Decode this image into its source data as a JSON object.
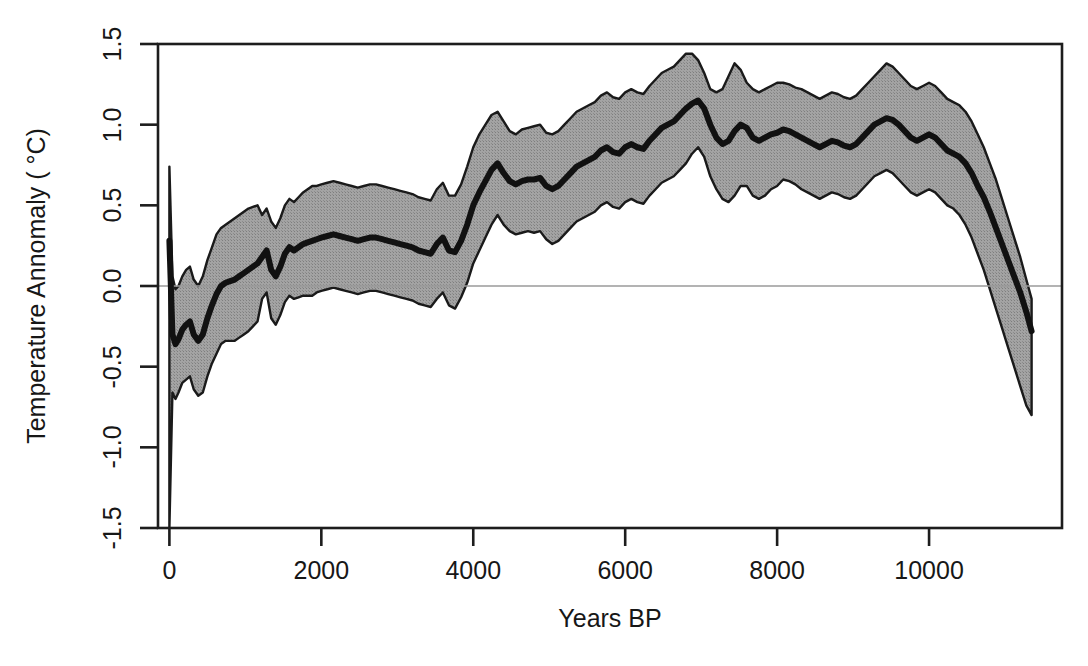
{
  "chart_data": {
    "type": "line",
    "title": "",
    "subtitle": "",
    "xlabel": "Years BP",
    "ylabel": "Temperature Annomaly ( °C)",
    "xlim": [
      -150,
      11750
    ],
    "ylim": [
      -1.5,
      1.5
    ],
    "xticks": [
      0,
      2000,
      4000,
      6000,
      8000,
      10000
    ],
    "xtick_labels": [
      "0",
      "2000",
      "4000",
      "6000",
      "8000",
      "10000"
    ],
    "yticks": [
      -1.5,
      -1.0,
      -0.5,
      0.0,
      0.5,
      1.0,
      1.5
    ],
    "ytick_labels": [
      "-1.5",
      "-1.0",
      "-0.5",
      "0.0",
      "0.5",
      "1.0",
      "1.5"
    ],
    "grid": false,
    "reference_lines": [
      {
        "axis": "y",
        "value": 0.0,
        "color": "#9a9a9a",
        "width": 1.5
      }
    ],
    "legend": null,
    "colors": {
      "band_fill": "#989898",
      "band_edge": "#1a1a1a",
      "mean_line": "#111111",
      "axis": "#1d1d1d",
      "zero_line": "#9a9a9a",
      "background": "#ffffff"
    },
    "series": [
      {
        "name": "mean temperature anomaly",
        "kind": "line",
        "line_width": 6,
        "color": "#111111",
        "x": [
          0,
          40,
          80,
          120,
          170,
          220,
          270,
          320,
          380,
          440,
          500,
          560,
          620,
          680,
          740,
          800,
          860,
          920,
          980,
          1040,
          1100,
          1160,
          1220,
          1280,
          1340,
          1400,
          1460,
          1520,
          1580,
          1640,
          1700,
          1760,
          1820,
          1880,
          1940,
          2000,
          2080,
          2160,
          2240,
          2320,
          2400,
          2480,
          2560,
          2640,
          2720,
          2800,
          2880,
          2960,
          3040,
          3120,
          3200,
          3280,
          3360,
          3440,
          3520,
          3600,
          3680,
          3760,
          3840,
          3920,
          4000,
          4080,
          4160,
          4240,
          4320,
          4400,
          4480,
          4560,
          4640,
          4720,
          4800,
          4880,
          4960,
          5040,
          5120,
          5200,
          5280,
          5360,
          5440,
          5520,
          5600,
          5680,
          5760,
          5840,
          5920,
          6000,
          6080,
          6160,
          6240,
          6320,
          6400,
          6480,
          6560,
          6640,
          6720,
          6800,
          6880,
          6960,
          7040,
          7120,
          7200,
          7280,
          7360,
          7440,
          7520,
          7600,
          7680,
          7760,
          7840,
          7920,
          8000,
          8080,
          8160,
          8240,
          8320,
          8400,
          8480,
          8560,
          8640,
          8720,
          8800,
          8880,
          8960,
          9040,
          9120,
          9200,
          9280,
          9360,
          9440,
          9520,
          9600,
          9680,
          9760,
          9840,
          9920,
          10000,
          10080,
          10160,
          10240,
          10320,
          10400,
          10480,
          10560,
          10640,
          10720,
          10800,
          10880,
          10960,
          11040,
          11120,
          11200,
          11280,
          11350
        ],
        "y": [
          0.28,
          -0.3,
          -0.36,
          -0.33,
          -0.27,
          -0.24,
          -0.22,
          -0.3,
          -0.34,
          -0.3,
          -0.2,
          -0.12,
          -0.05,
          0.0,
          0.02,
          0.03,
          0.04,
          0.06,
          0.08,
          0.1,
          0.12,
          0.14,
          0.18,
          0.22,
          0.1,
          0.06,
          0.12,
          0.2,
          0.24,
          0.22,
          0.24,
          0.26,
          0.27,
          0.28,
          0.29,
          0.3,
          0.31,
          0.32,
          0.31,
          0.3,
          0.29,
          0.28,
          0.29,
          0.3,
          0.3,
          0.29,
          0.28,
          0.27,
          0.26,
          0.25,
          0.24,
          0.22,
          0.21,
          0.2,
          0.26,
          0.3,
          0.22,
          0.21,
          0.28,
          0.38,
          0.5,
          0.58,
          0.65,
          0.72,
          0.76,
          0.7,
          0.65,
          0.63,
          0.65,
          0.66,
          0.66,
          0.67,
          0.62,
          0.6,
          0.62,
          0.66,
          0.7,
          0.74,
          0.76,
          0.78,
          0.8,
          0.84,
          0.86,
          0.83,
          0.82,
          0.86,
          0.88,
          0.86,
          0.85,
          0.9,
          0.94,
          0.98,
          1.0,
          1.02,
          1.06,
          1.1,
          1.13,
          1.15,
          1.1,
          1.0,
          0.92,
          0.88,
          0.9,
          0.96,
          1.0,
          0.98,
          0.92,
          0.9,
          0.92,
          0.94,
          0.95,
          0.97,
          0.96,
          0.94,
          0.92,
          0.9,
          0.88,
          0.86,
          0.88,
          0.9,
          0.89,
          0.87,
          0.86,
          0.88,
          0.92,
          0.96,
          1.0,
          1.02,
          1.04,
          1.03,
          1.0,
          0.96,
          0.92,
          0.9,
          0.92,
          0.94,
          0.92,
          0.88,
          0.84,
          0.82,
          0.8,
          0.76,
          0.7,
          0.62,
          0.55,
          0.46,
          0.36,
          0.26,
          0.16,
          0.06,
          -0.04,
          -0.16,
          -0.28
        ]
      },
      {
        "name": "uncertainty band upper (95%)",
        "kind": "band_upper",
        "color": "#1a1a1a",
        "x": [
          0,
          40,
          80,
          120,
          170,
          220,
          270,
          320,
          380,
          440,
          500,
          560,
          620,
          680,
          740,
          800,
          860,
          920,
          980,
          1040,
          1100,
          1160,
          1220,
          1280,
          1340,
          1400,
          1460,
          1520,
          1580,
          1640,
          1700,
          1760,
          1820,
          1880,
          1940,
          2000,
          2080,
          2160,
          2240,
          2320,
          2400,
          2480,
          2560,
          2640,
          2720,
          2800,
          2880,
          2960,
          3040,
          3120,
          3200,
          3280,
          3360,
          3440,
          3520,
          3600,
          3680,
          3760,
          3840,
          3920,
          4000,
          4080,
          4160,
          4240,
          4320,
          4400,
          4480,
          4560,
          4640,
          4720,
          4800,
          4880,
          4960,
          5040,
          5120,
          5200,
          5280,
          5360,
          5440,
          5520,
          5600,
          5680,
          5760,
          5840,
          5920,
          6000,
          6080,
          6160,
          6240,
          6320,
          6400,
          6480,
          6560,
          6640,
          6720,
          6800,
          6880,
          6960,
          7040,
          7120,
          7200,
          7280,
          7360,
          7440,
          7520,
          7600,
          7680,
          7760,
          7840,
          7920,
          8000,
          8080,
          8160,
          8240,
          8320,
          8400,
          8480,
          8560,
          8640,
          8720,
          8800,
          8880,
          8960,
          9040,
          9120,
          9200,
          9280,
          9360,
          9440,
          9520,
          9600,
          9680,
          9760,
          9840,
          9920,
          10000,
          10080,
          10160,
          10240,
          10320,
          10400,
          10480,
          10560,
          10640,
          10720,
          10800,
          10880,
          10960,
          11040,
          11120,
          11200,
          11280,
          11350
        ],
        "y": [
          0.74,
          0.06,
          -0.02,
          0.0,
          0.06,
          0.1,
          0.12,
          0.04,
          0.0,
          0.06,
          0.16,
          0.24,
          0.32,
          0.36,
          0.38,
          0.4,
          0.42,
          0.44,
          0.46,
          0.48,
          0.49,
          0.5,
          0.44,
          0.48,
          0.4,
          0.36,
          0.42,
          0.5,
          0.54,
          0.52,
          0.55,
          0.58,
          0.6,
          0.62,
          0.62,
          0.63,
          0.64,
          0.65,
          0.64,
          0.63,
          0.62,
          0.61,
          0.62,
          0.63,
          0.63,
          0.62,
          0.61,
          0.6,
          0.59,
          0.58,
          0.57,
          0.55,
          0.54,
          0.53,
          0.6,
          0.64,
          0.56,
          0.56,
          0.63,
          0.74,
          0.86,
          0.94,
          1.0,
          1.06,
          1.08,
          1.02,
          0.96,
          0.94,
          0.97,
          0.98,
          0.99,
          1.0,
          0.95,
          0.94,
          0.96,
          1.0,
          1.04,
          1.08,
          1.1,
          1.12,
          1.14,
          1.18,
          1.2,
          1.17,
          1.16,
          1.2,
          1.22,
          1.2,
          1.19,
          1.24,
          1.28,
          1.32,
          1.34,
          1.36,
          1.4,
          1.44,
          1.44,
          1.4,
          1.32,
          1.22,
          1.2,
          1.22,
          1.3,
          1.38,
          1.34,
          1.26,
          1.22,
          1.2,
          1.22,
          1.24,
          1.26,
          1.26,
          1.25,
          1.23,
          1.22,
          1.2,
          1.18,
          1.16,
          1.18,
          1.2,
          1.19,
          1.17,
          1.16,
          1.18,
          1.22,
          1.26,
          1.3,
          1.34,
          1.38,
          1.36,
          1.32,
          1.28,
          1.24,
          1.22,
          1.24,
          1.26,
          1.24,
          1.2,
          1.16,
          1.14,
          1.12,
          1.08,
          1.02,
          0.94,
          0.86,
          0.76,
          0.66,
          0.54,
          0.42,
          0.3,
          0.18,
          0.04,
          -0.08
        ]
      },
      {
        "name": "uncertainty band lower (95%)",
        "kind": "band_lower",
        "color": "#1a1a1a",
        "x": [
          0,
          40,
          80,
          120,
          170,
          220,
          270,
          320,
          380,
          440,
          500,
          560,
          620,
          680,
          740,
          800,
          860,
          920,
          980,
          1040,
          1100,
          1160,
          1220,
          1280,
          1340,
          1400,
          1460,
          1520,
          1580,
          1640,
          1700,
          1760,
          1820,
          1880,
          1940,
          2000,
          2080,
          2160,
          2240,
          2320,
          2400,
          2480,
          2560,
          2640,
          2720,
          2800,
          2880,
          2960,
          3040,
          3120,
          3200,
          3280,
          3360,
          3440,
          3520,
          3600,
          3680,
          3760,
          3840,
          3920,
          4000,
          4080,
          4160,
          4240,
          4320,
          4400,
          4480,
          4560,
          4640,
          4720,
          4800,
          4880,
          4960,
          5040,
          5120,
          5200,
          5280,
          5360,
          5440,
          5520,
          5600,
          5680,
          5760,
          5840,
          5920,
          6000,
          6080,
          6160,
          6240,
          6320,
          6400,
          6480,
          6560,
          6640,
          6720,
          6800,
          6880,
          6960,
          7040,
          7120,
          7200,
          7280,
          7360,
          7440,
          7520,
          7600,
          7680,
          7760,
          7840,
          7920,
          8000,
          8080,
          8160,
          8240,
          8320,
          8400,
          8480,
          8560,
          8640,
          8720,
          8800,
          8880,
          8960,
          9040,
          9120,
          9200,
          9280,
          9360,
          9440,
          9520,
          9600,
          9680,
          9760,
          9840,
          9920,
          10000,
          10080,
          10160,
          10240,
          10320,
          10400,
          10480,
          10560,
          10640,
          10720,
          10800,
          10880,
          10960,
          11040,
          11120,
          11200,
          11280,
          11350
        ],
        "y": [
          -1.5,
          -0.66,
          -0.7,
          -0.66,
          -0.6,
          -0.58,
          -0.56,
          -0.64,
          -0.68,
          -0.66,
          -0.56,
          -0.48,
          -0.42,
          -0.36,
          -0.34,
          -0.34,
          -0.34,
          -0.32,
          -0.3,
          -0.28,
          -0.25,
          -0.22,
          -0.08,
          -0.04,
          -0.2,
          -0.24,
          -0.18,
          -0.1,
          -0.06,
          -0.08,
          -0.07,
          -0.06,
          -0.06,
          -0.06,
          -0.04,
          -0.03,
          -0.02,
          -0.01,
          -0.02,
          -0.03,
          -0.04,
          -0.05,
          -0.04,
          -0.03,
          -0.03,
          -0.04,
          -0.05,
          -0.06,
          -0.07,
          -0.08,
          -0.09,
          -0.11,
          -0.12,
          -0.13,
          -0.08,
          -0.04,
          -0.12,
          -0.14,
          -0.07,
          0.02,
          0.14,
          0.22,
          0.3,
          0.38,
          0.44,
          0.38,
          0.34,
          0.32,
          0.33,
          0.34,
          0.33,
          0.34,
          0.29,
          0.26,
          0.28,
          0.32,
          0.36,
          0.4,
          0.42,
          0.44,
          0.46,
          0.5,
          0.52,
          0.49,
          0.48,
          0.52,
          0.54,
          0.52,
          0.51,
          0.56,
          0.6,
          0.64,
          0.66,
          0.68,
          0.72,
          0.76,
          0.82,
          0.86,
          0.8,
          0.68,
          0.6,
          0.54,
          0.52,
          0.56,
          0.62,
          0.62,
          0.56,
          0.54,
          0.56,
          0.6,
          0.62,
          0.66,
          0.65,
          0.63,
          0.6,
          0.58,
          0.56,
          0.54,
          0.56,
          0.58,
          0.57,
          0.55,
          0.54,
          0.56,
          0.6,
          0.64,
          0.68,
          0.7,
          0.72,
          0.7,
          0.66,
          0.62,
          0.58,
          0.56,
          0.58,
          0.6,
          0.58,
          0.54,
          0.5,
          0.48,
          0.44,
          0.38,
          0.3,
          0.2,
          0.1,
          -0.02,
          -0.14,
          -0.26,
          -0.38,
          -0.5,
          -0.62,
          -0.74,
          -0.8
        ]
      }
    ]
  },
  "axes": {
    "x_title": "Years BP",
    "y_title": "Temperature Annomaly ( °C)"
  }
}
